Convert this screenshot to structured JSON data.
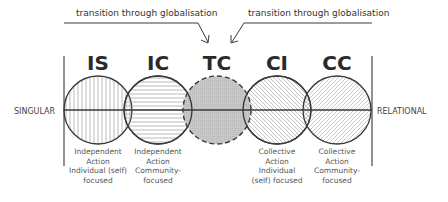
{
  "annotations": {
    "left_transition": "transition through globalisation",
    "right_transition": "transition through globalisation"
  },
  "axis": {
    "left_label": "SINGULAR",
    "right_label": "RELATIONAL"
  },
  "categories": [
    {
      "code": "IS",
      "pattern": "vertical-hatch",
      "caption": [
        "Independent",
        "Action",
        "Individual (self)",
        "focused"
      ]
    },
    {
      "code": "IC",
      "pattern": "horizontal-hatch",
      "caption": [
        "Independent",
        "Action",
        "Community-",
        "focused"
      ]
    },
    {
      "code": "TC",
      "pattern": "grey-fill-dashed",
      "caption": []
    },
    {
      "code": "CI",
      "pattern": "diagonal-hatch-back",
      "caption": [
        "Collective",
        "Action",
        "Individual",
        "(self) focused"
      ]
    },
    {
      "code": "CC",
      "pattern": "diagonal-hatch-forward",
      "caption": [
        "Collective",
        "Action",
        "Community-",
        "focused"
      ]
    }
  ],
  "colors": {
    "stroke": "#3a3a3a",
    "hatch": "#9a9a9a",
    "tc_fill": "#bdbdbd",
    "text": "#333333"
  }
}
